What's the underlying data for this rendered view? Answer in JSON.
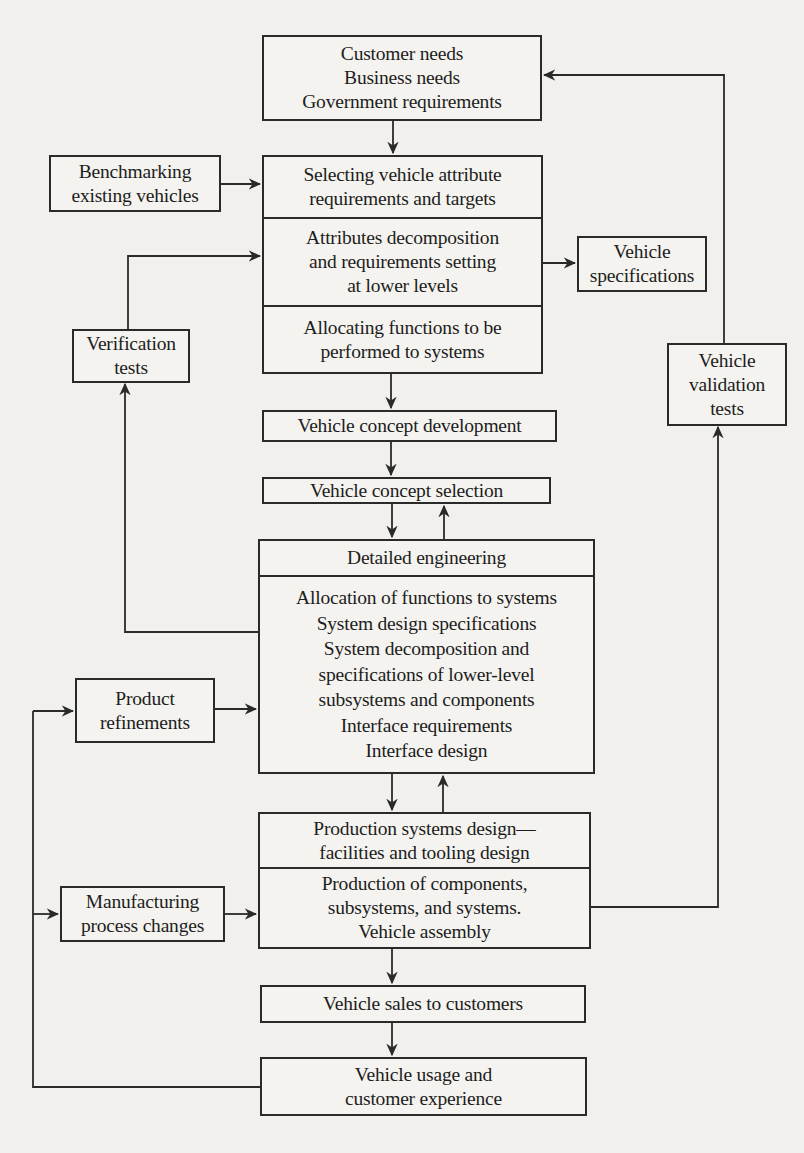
{
  "diagram": {
    "type": "flowchart",
    "nodes": {
      "needs": {
        "lines": [
          "Customer needs",
          "Business needs",
          "Government requirements"
        ]
      },
      "benchmarking": {
        "lines": [
          "Benchmarking",
          "existing vehicles"
        ]
      },
      "selecting_attributes": {
        "lines": [
          "Selecting vehicle attribute",
          "requirements and targets"
        ]
      },
      "attribute_decomposition": {
        "lines": [
          "Attributes decomposition",
          "and requirements setting",
          "at lower levels"
        ]
      },
      "allocating_functions": {
        "lines": [
          "Allocating functions to be",
          "performed to systems"
        ]
      },
      "vehicle_specifications": {
        "lines": [
          "Vehicle",
          "specifications"
        ]
      },
      "verification_tests": {
        "lines": [
          "Verification",
          "tests"
        ]
      },
      "validation_tests": {
        "lines": [
          "Vehicle",
          "validation",
          "tests"
        ]
      },
      "concept_development": {
        "lines": [
          "Vehicle concept development"
        ]
      },
      "concept_selection": {
        "lines": [
          "Vehicle concept selection"
        ]
      },
      "detailed_engineering": {
        "lines": [
          "Detailed engineering"
        ]
      },
      "system_design": {
        "lines": [
          "Allocation of functions to systems",
          "System design specifications",
          "System decomposition and",
          "specifications of lower-level",
          "subsystems and components",
          "Interface requirements",
          "Interface design"
        ]
      },
      "product_refinements": {
        "lines": [
          "Product",
          "refinements"
        ]
      },
      "production_design": {
        "lines": [
          "Production systems design—",
          "facilities and tooling design"
        ]
      },
      "production": {
        "lines": [
          "Production of components,",
          "subsystems, and systems.",
          "Vehicle assembly"
        ]
      },
      "manufacturing_changes": {
        "lines": [
          "Manufacturing",
          "process changes"
        ]
      },
      "sales": {
        "lines": [
          "Vehicle sales to customers"
        ]
      },
      "usage": {
        "lines": [
          "Vehicle usage and",
          "customer experience"
        ]
      }
    },
    "edges": [
      {
        "from": "needs",
        "to": "selecting_attributes"
      },
      {
        "from": "benchmarking",
        "to": "selecting_attributes"
      },
      {
        "from": "verification_tests",
        "to": "attribute_decomposition"
      },
      {
        "from": "attribute_decomposition",
        "to": "vehicle_specifications"
      },
      {
        "from": "validation_tests",
        "to": "needs"
      },
      {
        "from": "allocating_functions",
        "to": "concept_development"
      },
      {
        "from": "concept_development",
        "to": "concept_selection"
      },
      {
        "from": "concept_selection",
        "to": "detailed_engineering"
      },
      {
        "from": "detailed_engineering",
        "to": "concept_selection"
      },
      {
        "from": "system_design",
        "to": "verification_tests"
      },
      {
        "from": "product_refinements",
        "to": "system_design"
      },
      {
        "from": "system_design",
        "to": "production_design"
      },
      {
        "from": "production_design",
        "to": "system_design"
      },
      {
        "from": "production",
        "to": "validation_tests"
      },
      {
        "from": "manufacturing_changes",
        "to": "production"
      },
      {
        "from": "production",
        "to": "sales"
      },
      {
        "from": "sales",
        "to": "usage"
      },
      {
        "from": "usage",
        "to": "product_refinements"
      },
      {
        "from": "usage",
        "to": "manufacturing_changes"
      }
    ]
  },
  "colors": {
    "paper": "#f1f0ec",
    "ink": "#2a2a2a",
    "bleed_text": "#d9d8d3"
  }
}
